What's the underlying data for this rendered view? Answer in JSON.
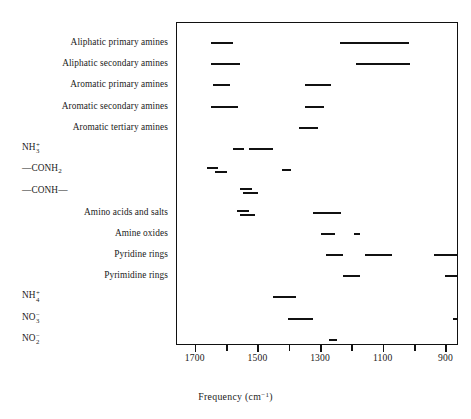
{
  "chart_data": {
    "type": "bar",
    "title": "",
    "xlabel": "Frequency (cm⁻¹)",
    "ylabel": "",
    "orientation": "horizontal-ranges",
    "axis_direction": "decreasing-left-to-right",
    "xlim": [
      1760,
      860
    ],
    "xticks": [
      1700,
      1600,
      1500,
      1400,
      1300,
      1200,
      1100,
      1000,
      900
    ],
    "xtick_labels": [
      "1700",
      "",
      "1500",
      "",
      "1300",
      "",
      "1100",
      "",
      "900"
    ],
    "grid": false,
    "legend": null,
    "note": "Infrared group-frequency correlation chart: each row is a functional group, each bar spans the wavenumber range of its characteristic absorption band.",
    "categories": [
      "Aliphatic primary amines",
      "Aliphatic secondary amines",
      "Aromatic primary amines",
      "Aromatic secondary amines",
      "Aromatic tertiary amines",
      "NH3+",
      "-CONH2",
      "-CONH-",
      "Amino acids and salts",
      "Amine oxides",
      "Pyridine rings",
      "Pyrimidine rings",
      "NH4+",
      "NO3-",
      "NO2-"
    ],
    "rows": [
      {
        "label_html": "Aliphatic primary amines",
        "bands": [
          {
            "from": 1650,
            "to": 1580,
            "offset": 0
          },
          {
            "from": 1240,
            "to": 1020,
            "offset": 0
          }
        ]
      },
      {
        "label_html": "Aliphatic secondary amines",
        "bands": [
          {
            "from": 1650,
            "to": 1560,
            "offset": 0
          },
          {
            "from": 1190,
            "to": 1015,
            "offset": 0
          }
        ]
      },
      {
        "label_html": "Aromatic primary amines",
        "bands": [
          {
            "from": 1645,
            "to": 1590,
            "offset": 0
          },
          {
            "from": 1350,
            "to": 1270,
            "offset": 0
          }
        ]
      },
      {
        "label_html": "Aromatic secondary amines",
        "bands": [
          {
            "from": 1650,
            "to": 1565,
            "offset": 0
          },
          {
            "from": 1350,
            "to": 1290,
            "offset": 0
          }
        ]
      },
      {
        "label_html": "Aromatic tertiary amines",
        "bands": [
          {
            "from": 1370,
            "to": 1310,
            "offset": 0
          }
        ]
      },
      {
        "label_html": "NH3+",
        "bands": [
          {
            "from": 1580,
            "to": 1545,
            "offset": 0
          },
          {
            "from": 1530,
            "to": 1455,
            "offset": 0
          }
        ]
      },
      {
        "label_html": "-CONH2",
        "bands": [
          {
            "from": 1665,
            "to": 1630,
            "offset": -2
          },
          {
            "from": 1640,
            "to": 1600,
            "offset": 2
          },
          {
            "from": 1425,
            "to": 1395,
            "offset": 0
          }
        ]
      },
      {
        "label_html": "-CONH-",
        "bands": [
          {
            "from": 1560,
            "to": 1520,
            "offset": -2
          },
          {
            "from": 1550,
            "to": 1500,
            "offset": 2
          }
        ]
      },
      {
        "label_html": "Amino acids and salts",
        "bands": [
          {
            "from": 1570,
            "to": 1530,
            "offset": -2
          },
          {
            "from": 1560,
            "to": 1510,
            "offset": 2
          },
          {
            "from": 1325,
            "to": 1235,
            "offset": 0
          }
        ]
      },
      {
        "label_html": "Amine oxides",
        "bands": [
          {
            "from": 1300,
            "to": 1255,
            "offset": 0
          },
          {
            "from": 1195,
            "to": 1175,
            "offset": 0
          }
        ]
      },
      {
        "label_html": "Pyridine rings",
        "bands": [
          {
            "from": 1285,
            "to": 1230,
            "offset": 0
          },
          {
            "from": 1160,
            "to": 1075,
            "offset": 0
          },
          {
            "from": 940,
            "to": 860,
            "offset": 0
          }
        ]
      },
      {
        "label_html": "Pyrimidine rings",
        "bands": [
          {
            "from": 1230,
            "to": 1175,
            "offset": 0
          },
          {
            "from": 905,
            "to": 860,
            "offset": 0
          }
        ]
      },
      {
        "label_html": "NH4+",
        "bands": [
          {
            "from": 1455,
            "to": 1380,
            "offset": 0
          }
        ]
      },
      {
        "label_html": "NO3-",
        "bands": [
          {
            "from": 1405,
            "to": 1325,
            "offset": 0
          },
          {
            "from": 880,
            "to": 860,
            "offset": 0
          }
        ]
      },
      {
        "label_html": "NO2-",
        "bands": [
          {
            "from": 1275,
            "to": 1250,
            "offset": 0
          }
        ]
      }
    ]
  },
  "labels": {
    "rows": [
      {
        "type": "plain",
        "text": "Aliphatic primary amines"
      },
      {
        "type": "plain",
        "text": "Aliphatic secondary amines"
      },
      {
        "type": "plain",
        "text": "Aromatic primary amines"
      },
      {
        "type": "plain",
        "text": "Aromatic secondary amines"
      },
      {
        "type": "plain",
        "text": "Aromatic tertiary amines"
      },
      {
        "type": "formula",
        "base": "NH",
        "sub": "3",
        "sup": "+",
        "prefix": "",
        "suffix": ""
      },
      {
        "type": "formula",
        "base": "CONH",
        "sub": "2",
        "sup": "",
        "prefix": "—",
        "suffix": ""
      },
      {
        "type": "formula",
        "base": "CONH",
        "sub": "",
        "sup": "",
        "prefix": "—",
        "suffix": "—"
      },
      {
        "type": "plain",
        "text": "Amino acids and salts"
      },
      {
        "type": "plain",
        "text": "Amine oxides"
      },
      {
        "type": "plain",
        "text": "Pyridine rings"
      },
      {
        "type": "plain",
        "text": "Pyrimidine rings"
      },
      {
        "type": "formula",
        "base": "NH",
        "sub": "4",
        "sup": "+",
        "prefix": "",
        "suffix": ""
      },
      {
        "type": "formula",
        "base": "NO",
        "sub": "3",
        "sup": "−",
        "prefix": "",
        "suffix": ""
      },
      {
        "type": "formula",
        "base": "NO",
        "sub": "2",
        "sup": "−",
        "prefix": "",
        "suffix": ""
      }
    ]
  },
  "axis": {
    "title_text": "Frequency (cm",
    "title_sup": "−1",
    "title_close": ")"
  }
}
